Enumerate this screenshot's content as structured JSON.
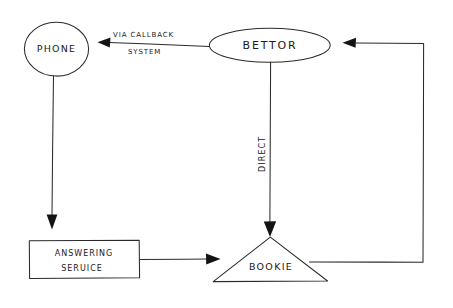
{
  "diagram": {
    "background_color": "#ffffff",
    "ink_color": "#2b2b2b",
    "style": "hand-drawn pencil sketch flowchart",
    "nodes": [
      {
        "id": "phone",
        "label": "PHONE",
        "shape": "circle"
      },
      {
        "id": "bettor",
        "label": "BETTOR",
        "shape": "ellipse"
      },
      {
        "id": "answering_service",
        "label_line_1": "ANSWERING",
        "label_line_2": "SERUICE",
        "shape": "rectangle"
      },
      {
        "id": "bookie",
        "label": "BOOKIE",
        "shape": "triangle"
      }
    ],
    "edges": [
      {
        "id": "bettor-to-phone",
        "from": "bettor",
        "to": "phone",
        "label_line_1": "VIA  CALLBACK",
        "label_line_2": "SYSTEM",
        "direction": "left"
      },
      {
        "id": "phone-to-answering-service",
        "from": "phone",
        "to": "answering_service",
        "label": "",
        "direction": "down"
      },
      {
        "id": "bettor-to-bookie",
        "from": "bettor",
        "to": "bookie",
        "label": "DIRECT",
        "direction": "down",
        "label_orientation": "vertical"
      },
      {
        "id": "answering-service-to-bookie",
        "from": "answering_service",
        "to": "bookie",
        "label": "",
        "direction": "right"
      },
      {
        "id": "bookie-to-bettor",
        "from": "bookie",
        "to": "bettor",
        "label": "",
        "direction": "return-loop-left"
      }
    ]
  }
}
